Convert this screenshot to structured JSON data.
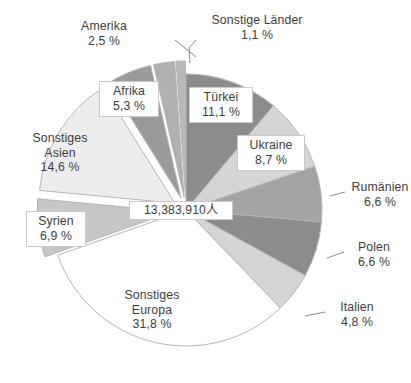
{
  "chart_data": {
    "type": "pie",
    "title": "",
    "center_label": "13,383,910人",
    "total": 13383910,
    "unit": "人",
    "value_suffix": " %",
    "decimal_separator": ",",
    "legend": "none",
    "slices": [
      {
        "label": "Türkei",
        "value": 11.1,
        "display": "11,1 %",
        "color": "#8c8c8c",
        "exploded": false
      },
      {
        "label": "Ukraine",
        "value": 8.7,
        "display": "8,7 %",
        "color": "#d5d5d5",
        "exploded": false
      },
      {
        "label": "Rumänien",
        "value": 6.6,
        "display": "6,6 %",
        "color": "#a3a3a3",
        "exploded": false
      },
      {
        "label": "Polen",
        "value": 6.6,
        "display": "6,6 %",
        "color": "#8c8c8c",
        "exploded": false
      },
      {
        "label": "Italien",
        "value": 4.8,
        "display": "4,8 %",
        "color": "#d5d5d5",
        "exploded": false
      },
      {
        "label": "Sonstiges Europa",
        "value": 31.8,
        "display": "31,8 %",
        "color": "#ffffff",
        "exploded": false
      },
      {
        "label": "Syrien",
        "value": 6.9,
        "display": "6,9 %",
        "color": "#c6c6c6",
        "exploded": true
      },
      {
        "label": "Sonstiges Asien",
        "value": 14.6,
        "display": "14,6 %",
        "color": "#ededed",
        "exploded": true
      },
      {
        "label": "Afrika",
        "value": 5.3,
        "display": "5,3 %",
        "color": "#9a9a9a",
        "exploded": true
      },
      {
        "label": "Amerika",
        "value": 2.5,
        "display": "2,5 %",
        "color": "#b0b0b0",
        "exploded": true
      },
      {
        "label": "Sonstige Länder",
        "value": 1.1,
        "display": "1,1 %",
        "color": "#b8b8b8",
        "exploded": true
      }
    ]
  },
  "labels": {
    "tuerkei": {
      "name": "Türkei",
      "pct": "11,1 %"
    },
    "ukraine": {
      "name": "Ukraine",
      "pct": "8,7 %"
    },
    "rumaenien": {
      "name": "Rumänien",
      "pct": "6,6 %"
    },
    "polen": {
      "name": "Polen",
      "pct": "6,6 %"
    },
    "italien": {
      "name": "Italien",
      "pct": "4,8 %"
    },
    "sonstiges_europa": {
      "name": "Sonstiges",
      "name2": "Europa",
      "pct": "31,8 %"
    },
    "syrien": {
      "name": "Syrien",
      "pct": "6,9 %"
    },
    "sonstiges_asien": {
      "name": "Sonstiges",
      "name2": "Asien",
      "pct": "14,6 %"
    },
    "afrika": {
      "name": "Afrika",
      "pct": "5,3 %"
    },
    "amerika": {
      "name": "Amerika",
      "pct": "2,5 %"
    },
    "sonstige_laender": {
      "name": "Sonstige Länder",
      "pct": "1,1 %"
    },
    "center": {
      "text": "13,383,910人"
    }
  },
  "colors": {
    "text": "#3d3d3d",
    "label_box_bg": "#ffffff",
    "label_box_border": "#c9c9c9",
    "leader_line": "#8a8a8a",
    "slice_stroke": "#b5b5b5"
  }
}
